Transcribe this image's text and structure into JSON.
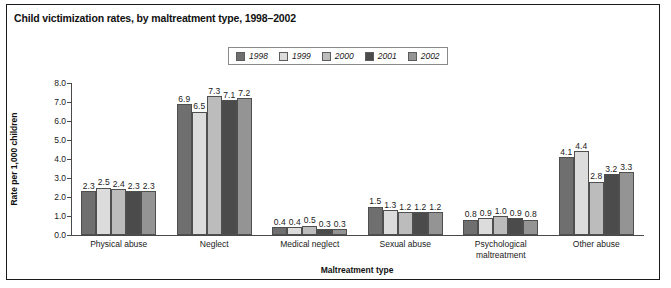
{
  "figure": {
    "title": "Child victimization rates, by maltreatment type, 1998–2002"
  },
  "chart_data": {
    "type": "bar",
    "title": "Child victimization rates, by maltreatment type, 1998–2002",
    "xlabel": "Maltreatment type",
    "ylabel": "Rate per 1,000 children",
    "ylim": [
      0,
      8
    ],
    "yticks": [
      "0.0",
      "1.0",
      "2.0",
      "3.0",
      "4.0",
      "5.0",
      "6.0",
      "7.0",
      "8.0"
    ],
    "grid": false,
    "legend_position": "top-center",
    "categories": [
      "Physical abuse",
      "Neglect",
      "Medical neglect",
      "Sexual abuse",
      "Psychological maltreatment",
      "Other abuse"
    ],
    "category_lines": [
      [
        "Physical abuse"
      ],
      [
        "Neglect"
      ],
      [
        "Medical neglect"
      ],
      [
        "Sexual abuse"
      ],
      [
        "Psychological",
        "maltreatment"
      ],
      [
        "Other abuse"
      ]
    ],
    "series": [
      {
        "name": "1998",
        "color": "#6f6f6f",
        "values": [
          2.3,
          6.9,
          0.4,
          1.5,
          0.8,
          4.1
        ],
        "labels": [
          "2.3",
          "6.9",
          "0.4",
          "1.5",
          "0.8",
          "4.1"
        ]
      },
      {
        "name": "1999",
        "color": "#dcdcdc",
        "values": [
          2.5,
          6.5,
          0.4,
          1.3,
          0.9,
          4.4
        ],
        "labels": [
          "2.5",
          "6.5",
          "0.4",
          "1.3",
          "0.9",
          "4.4"
        ]
      },
      {
        "name": "2000",
        "color": "#bcbcbc",
        "values": [
          2.4,
          7.3,
          0.5,
          1.2,
          1.0,
          2.8
        ],
        "labels": [
          "2.4",
          "7.3",
          "0.5",
          "1.2",
          "1.0",
          "2.8"
        ]
      },
      {
        "name": "2001",
        "color": "#4b4b4b",
        "values": [
          2.3,
          7.1,
          0.3,
          1.2,
          0.9,
          3.2
        ],
        "labels": [
          "2.3",
          "7.1",
          "0.3",
          "1.2",
          "0.9",
          "3.2"
        ]
      },
      {
        "name": "2002",
        "color": "#949494",
        "values": [
          2.3,
          7.2,
          0.3,
          1.2,
          0.8,
          3.3
        ],
        "labels": [
          "2.3",
          "7.2",
          "0.3",
          "1.2",
          "0.8",
          "3.3"
        ]
      }
    ]
  }
}
